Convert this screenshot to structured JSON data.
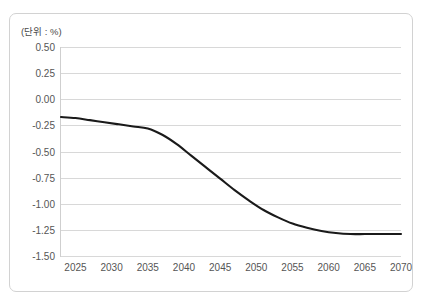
{
  "chart_data": {
    "type": "line",
    "title": "",
    "subtitle": "",
    "unit_label": "(단위 : %)",
    "xlabel": "",
    "ylabel": "",
    "xlim": [
      2023,
      2070
    ],
    "ylim": [
      -1.5,
      0.5
    ],
    "grid": true,
    "legend": false,
    "legend_position": "none",
    "line_color": "#1a1a1a",
    "grid_color": "#d8d8d8",
    "border_color": "#d2d2d2",
    "y_ticks": [
      "0.50",
      "0.25",
      "0.00",
      "-0.25",
      "-0.50",
      "-0.75",
      "-1.00",
      "-1.25",
      "-1.50"
    ],
    "y_tick_values": [
      0.5,
      0.25,
      0,
      -0.25,
      -0.5,
      -0.75,
      -1.0,
      -1.25,
      -1.5
    ],
    "x_ticks": [
      "2025",
      "2030",
      "2035",
      "2040",
      "2045",
      "2050",
      "2055",
      "2060",
      "2065",
      "2070"
    ],
    "x_tick_values": [
      2025,
      2030,
      2035,
      2040,
      2045,
      2050,
      2055,
      2060,
      2065,
      2070
    ],
    "series": [
      {
        "name": "",
        "x": [
          2023,
          2025,
          2027,
          2029,
          2031,
          2033,
          2035,
          2037,
          2039,
          2041,
          2043,
          2045,
          2047,
          2049,
          2051,
          2053,
          2055,
          2057,
          2059,
          2061,
          2063,
          2065,
          2067,
          2070
        ],
        "values": [
          -0.17,
          -0.18,
          -0.2,
          -0.22,
          -0.24,
          -0.26,
          -0.28,
          -0.34,
          -0.43,
          -0.54,
          -0.65,
          -0.76,
          -0.87,
          -0.97,
          -1.06,
          -1.13,
          -1.19,
          -1.23,
          -1.26,
          -1.28,
          -1.29,
          -1.29,
          -1.29,
          -1.29
        ]
      }
    ]
  }
}
